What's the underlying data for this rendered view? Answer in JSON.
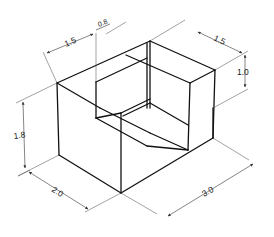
{
  "diagram": {
    "type": "isometric-block-with-notch",
    "dimensions": {
      "width_front": "2.0",
      "length_side": "3.0",
      "height": "1.8",
      "notch_depth": "1.5",
      "notch_width": "0.8",
      "step_length": "1.5",
      "step_height": "1.0"
    }
  }
}
